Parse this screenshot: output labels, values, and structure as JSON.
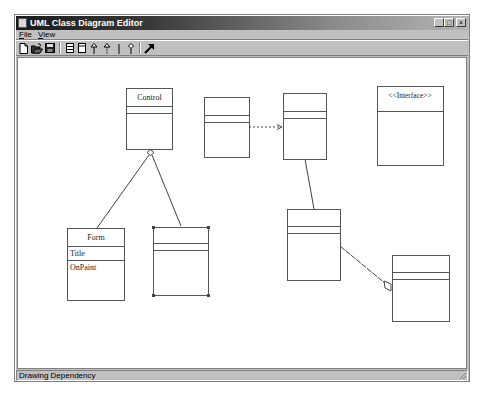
{
  "window": {
    "title": "UML Class Diagram Editor",
    "controls": {
      "minimize": "_",
      "maximize": "□",
      "close": "×"
    }
  },
  "menu": {
    "items": [
      {
        "label": "File",
        "accel": "F",
        "rest": "ile"
      },
      {
        "label": "View",
        "accel": "V",
        "rest": "iew"
      }
    ]
  },
  "toolbar": {
    "buttons": [
      {
        "name": "new-icon",
        "tooltip": "New"
      },
      {
        "name": "open-icon",
        "tooltip": "Open"
      },
      {
        "name": "save-icon",
        "tooltip": "Save"
      },
      {
        "name": "class-icon",
        "tooltip": "Class"
      },
      {
        "name": "interface-icon",
        "tooltip": "Interface"
      },
      {
        "name": "generalization-icon",
        "tooltip": "Generalization"
      },
      {
        "name": "realization-icon",
        "tooltip": "Realization"
      },
      {
        "name": "association-icon",
        "tooltip": "Association"
      },
      {
        "name": "aggregation-icon",
        "tooltip": "Aggregation"
      },
      {
        "name": "dependency-icon",
        "tooltip": "Dependency"
      }
    ]
  },
  "diagram": {
    "classes": [
      {
        "id": "control",
        "name": "Control",
        "attributes": [],
        "operations": []
      },
      {
        "id": "form",
        "name": "Form",
        "attributes": [
          "Title"
        ],
        "operations": [
          "OnPaint"
        ]
      },
      {
        "id": "selected",
        "name": "",
        "attributes": [],
        "operations": [],
        "selected": true
      },
      {
        "id": "c4",
        "name": "",
        "attributes": [],
        "operations": []
      },
      {
        "id": "c5",
        "name": "",
        "attributes": [],
        "operations": []
      },
      {
        "id": "c6",
        "name": "",
        "attributes": [],
        "operations": []
      },
      {
        "id": "c7",
        "name": "",
        "attributes": [],
        "operations": []
      },
      {
        "id": "interface",
        "name": "<<Interface>>",
        "stereotype": true
      }
    ],
    "relationships": [
      {
        "type": "generalization",
        "from": "form",
        "to": "control"
      },
      {
        "type": "generalization",
        "from": "selected",
        "to": "control"
      },
      {
        "type": "dependency",
        "from": "c4",
        "to": "c5"
      },
      {
        "type": "association",
        "from": "c5",
        "to": "c6"
      },
      {
        "type": "aggregation",
        "from": "c6",
        "to": "c7"
      }
    ]
  },
  "status": {
    "text": "Drawing Dependency"
  }
}
